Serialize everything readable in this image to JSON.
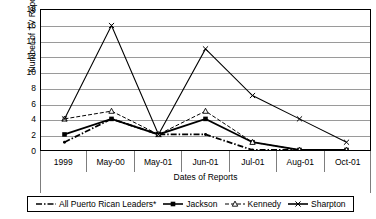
{
  "chart_data": {
    "type": "line",
    "title": "",
    "xlabel": "Dates of Reports",
    "ylabel": "Number of TV Reports",
    "categories": [
      "1999",
      "May-00",
      "May-01",
      "Jun-01",
      "Jul-01",
      "Aug-01",
      "Oct-01"
    ],
    "ylim": [
      0,
      18
    ],
    "ytick_step": 2,
    "yticks": [
      18,
      16,
      14,
      12,
      10,
      8,
      6,
      4,
      2,
      0
    ],
    "grid": true,
    "legend_position": "bottom",
    "series": [
      {
        "name": "All Puerto Rican Leaders*",
        "marker": "dash-dot-line",
        "line_style": "dash-dot",
        "color": "#000000",
        "values": [
          1,
          4,
          2,
          2,
          0,
          0,
          0
        ]
      },
      {
        "name": "Jackson",
        "marker": "square",
        "line_style": "solid",
        "color": "#000000",
        "values": [
          2,
          4,
          2,
          4,
          1,
          0,
          0
        ]
      },
      {
        "name": "Kennedy",
        "marker": "triangle",
        "line_style": "dashed",
        "color": "#000000",
        "values": [
          4,
          5,
          2,
          5,
          1,
          0,
          0
        ]
      },
      {
        "name": "Sharpton",
        "marker": "cross",
        "line_style": "solid",
        "color": "#000000",
        "values": [
          4,
          16,
          2,
          13,
          7,
          4,
          1
        ]
      }
    ]
  },
  "legend": {
    "items": [
      {
        "label": "All Puerto Rican Leaders*",
        "icon": "dash-dot-line-marker"
      },
      {
        "label": "Jackson",
        "icon": "square-line-marker"
      },
      {
        "label": "Kennedy",
        "icon": "triangle-dashed-line-marker"
      },
      {
        "label": "Sharpton",
        "icon": "cross-line-marker"
      }
    ]
  }
}
